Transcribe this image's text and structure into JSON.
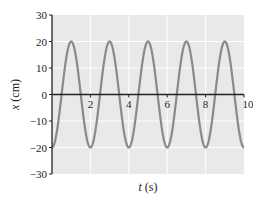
{
  "panel_label": "(b)",
  "chart_data": {
    "type": "line",
    "title": "",
    "xlabel": "t (s)",
    "ylabel": "x (cm)",
    "xlim": [
      0,
      10
    ],
    "ylim": [
      -30,
      30
    ],
    "x_ticks": [
      2,
      4,
      6,
      8,
      10
    ],
    "x_tick_labels": [
      "2",
      "4",
      "6",
      "8",
      "10"
    ],
    "y_ticks": [
      -30,
      -20,
      -10,
      0,
      10,
      20,
      30
    ],
    "y_tick_labels": [
      "−30",
      "−20",
      "−10",
      "0",
      "10",
      "20",
      "30"
    ],
    "grid": true,
    "legend": null,
    "series": [
      {
        "name": "x(t) = -20 cos(π t)",
        "amplitude": 20,
        "period": 2,
        "x": [
          0,
          0.5,
          1,
          1.5,
          2,
          2.5,
          3,
          3.5,
          4,
          4.5,
          5,
          5.5,
          6,
          6.5,
          7,
          7.5,
          8,
          8.5,
          9,
          9.5,
          10
        ],
        "values": [
          -20,
          0,
          20,
          0,
          -20,
          0,
          20,
          0,
          -20,
          0,
          20,
          0,
          -20,
          0,
          20,
          0,
          -20,
          0,
          20,
          0,
          -20
        ]
      }
    ],
    "colors": {
      "background": "#e9e9e9",
      "grid": "#ffffff",
      "line": "#8a8a8a",
      "axis": "#222222"
    }
  }
}
